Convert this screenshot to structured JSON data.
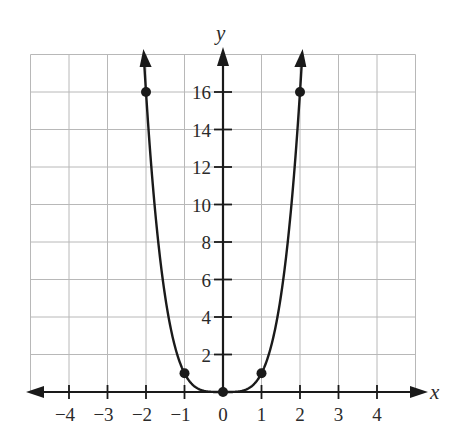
{
  "chart_data": {
    "type": "line",
    "title": "",
    "function": "y = x^4",
    "xlabel": "x",
    "ylabel": "y",
    "xlim": [
      -5,
      5
    ],
    "ylim": [
      0,
      18
    ],
    "grid": true,
    "x_ticks": [
      -4,
      -3,
      -2,
      -1,
      0,
      1,
      2,
      3,
      4
    ],
    "x_tick_labels": [
      "−4",
      "−3",
      "−2",
      "−1",
      "0",
      "1",
      "2",
      "3",
      "4"
    ],
    "y_ticks": [
      2,
      4,
      6,
      8,
      10,
      12,
      14,
      16
    ],
    "y_tick_labels": [
      "2",
      "4",
      "6",
      "8",
      "10",
      "12",
      "14",
      "16"
    ],
    "points": [
      {
        "x": -2,
        "y": 16
      },
      {
        "x": -1,
        "y": 1
      },
      {
        "x": 0,
        "y": 0
      },
      {
        "x": 1,
        "y": 1
      },
      {
        "x": 2,
        "y": 16
      }
    ],
    "curve_ends": "arrows at both ends (continues upward)",
    "legend": null
  }
}
